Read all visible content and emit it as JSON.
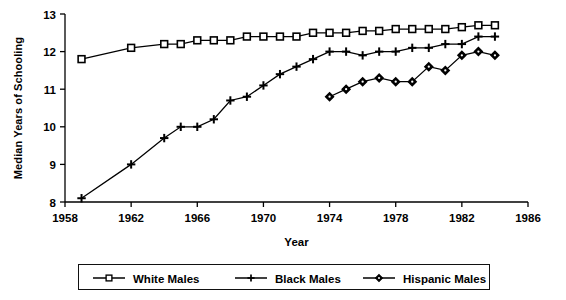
{
  "chart_data": {
    "type": "line",
    "title": "",
    "xlabel": "Year",
    "ylabel": "Median Years of Schooling",
    "xlim": [
      1958,
      1986
    ],
    "ylim": [
      8,
      13
    ],
    "xticks": [
      1958,
      1962,
      1966,
      1970,
      1974,
      1978,
      1982,
      1986
    ],
    "yticks": [
      8,
      9,
      10,
      11,
      12,
      13
    ],
    "grid": false,
    "legend_position": "bottom",
    "series": [
      {
        "name": "White Males",
        "marker": "square",
        "color": "#000000",
        "x": [
          1959,
          1962,
          1964,
          1965,
          1966,
          1967,
          1968,
          1969,
          1970,
          1971,
          1972,
          1973,
          1974,
          1975,
          1976,
          1977,
          1978,
          1979,
          1980,
          1981,
          1982,
          1983,
          1984
        ],
        "y": [
          11.8,
          12.1,
          12.2,
          12.2,
          12.3,
          12.3,
          12.3,
          12.4,
          12.4,
          12.4,
          12.4,
          12.5,
          12.5,
          12.5,
          12.55,
          12.55,
          12.6,
          12.6,
          12.6,
          12.6,
          12.65,
          12.7,
          12.7
        ]
      },
      {
        "name": "Black Males",
        "marker": "plus",
        "color": "#000000",
        "x": [
          1959,
          1962,
          1964,
          1965,
          1966,
          1967,
          1968,
          1969,
          1970,
          1971,
          1972,
          1973,
          1974,
          1975,
          1976,
          1977,
          1978,
          1979,
          1980,
          1981,
          1982,
          1983,
          1984
        ],
        "y": [
          8.1,
          9.0,
          9.7,
          10.0,
          10.0,
          10.2,
          10.7,
          10.8,
          11.1,
          11.4,
          11.6,
          11.8,
          12.0,
          12.0,
          11.9,
          12.0,
          12.0,
          12.1,
          12.1,
          12.2,
          12.2,
          12.4,
          12.4
        ]
      },
      {
        "name": "Hispanic Males",
        "marker": "diamond",
        "color": "#000000",
        "x": [
          1974,
          1975,
          1976,
          1977,
          1978,
          1979,
          1980,
          1981,
          1982,
          1983,
          1984
        ],
        "y": [
          10.8,
          11.0,
          11.2,
          11.3,
          11.2,
          11.2,
          11.6,
          11.5,
          11.9,
          12.0,
          11.9
        ]
      }
    ]
  },
  "axes": {
    "x_title": "Year",
    "y_title": "Median Years of Schooling",
    "x_tick_labels": [
      "1958",
      "1962",
      "1966",
      "1970",
      "1974",
      "1978",
      "1982",
      "1986"
    ],
    "y_tick_labels": [
      "8",
      "9",
      "10",
      "11",
      "12",
      "13"
    ]
  },
  "legend": {
    "items": [
      {
        "label": "White Males",
        "marker": "square"
      },
      {
        "label": "Black Males",
        "marker": "plus"
      },
      {
        "label": "Hispanic Males",
        "marker": "diamond"
      }
    ]
  }
}
